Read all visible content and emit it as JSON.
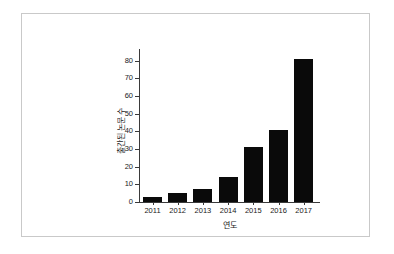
{
  "figure": {
    "background_color": "#ffffff",
    "frame_border_color": "#c9c9c9",
    "bar_color": "#0a0a0a",
    "axis_color": "#3a3a3a",
    "text_color": "#1a1a1a"
  },
  "chart_data": {
    "type": "bar",
    "title": "",
    "subtitle": "",
    "xlabel": "연도",
    "ylabel": "출간된 논문 수",
    "categories": [
      "2011",
      "2012",
      "2013",
      "2014",
      "2015",
      "2016",
      "2017"
    ],
    "values": [
      3,
      5,
      7.5,
      14,
      31,
      41,
      81
    ],
    "ylim": [
      0,
      85
    ],
    "yticks": [
      0,
      10,
      20,
      30,
      40,
      50,
      60,
      70,
      80
    ],
    "ytick_labels": [
      "0",
      "10",
      "20",
      "30",
      "40",
      "50",
      "60",
      "70",
      "80"
    ],
    "xtick_labels": [
      "2011",
      "2012",
      "2013",
      "2014",
      "2015",
      "2016",
      "2017"
    ],
    "grid": false,
    "legend": null,
    "legend_position": "none",
    "annotations": [],
    "series": [
      {
        "name": "출간된 논문 수",
        "values": [
          3,
          5,
          7.5,
          14,
          31,
          41,
          81
        ],
        "color": "#0a0a0a"
      }
    ]
  }
}
